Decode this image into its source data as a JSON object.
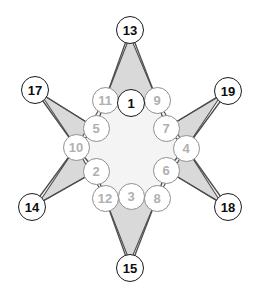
{
  "figure": {
    "type": "graph-diagram",
    "shape": "six-pointed-star",
    "background_color": "#ffffff",
    "star_point_fill": "#d9d9d9",
    "star_core_fill": "#f4f4f4",
    "edge_color": "#4d4d4d"
  },
  "nodes": [
    {
      "id": "13",
      "label": "13",
      "x": 130,
      "y": 30,
      "style": "outer"
    },
    {
      "id": "17",
      "label": "17",
      "x": 35,
      "y": 90,
      "style": "outer"
    },
    {
      "id": "19",
      "label": "19",
      "x": 228,
      "y": 91,
      "style": "outer"
    },
    {
      "id": "14",
      "label": "14",
      "x": 32,
      "y": 207,
      "style": "outer"
    },
    {
      "id": "18",
      "label": "18",
      "x": 228,
      "y": 207,
      "style": "outer"
    },
    {
      "id": "15",
      "label": "15",
      "x": 130,
      "y": 268,
      "style": "outer"
    },
    {
      "id": "1",
      "label": "1",
      "x": 131,
      "y": 103,
      "style": "hub"
    },
    {
      "id": "11",
      "label": "11",
      "x": 105,
      "y": 100,
      "style": "inner"
    },
    {
      "id": "9",
      "label": "9",
      "x": 157,
      "y": 100,
      "style": "inner"
    },
    {
      "id": "5",
      "label": "5",
      "x": 96,
      "y": 128,
      "style": "inner"
    },
    {
      "id": "7",
      "label": "7",
      "x": 166,
      "y": 128,
      "style": "inner"
    },
    {
      "id": "10",
      "label": "10",
      "x": 76,
      "y": 147,
      "style": "inner"
    },
    {
      "id": "4",
      "label": "4",
      "x": 186,
      "y": 148,
      "style": "inner"
    },
    {
      "id": "2",
      "label": "2",
      "x": 96,
      "y": 171,
      "style": "inner"
    },
    {
      "id": "6",
      "label": "6",
      "x": 166,
      "y": 170,
      "style": "inner"
    },
    {
      "id": "12",
      "label": "12",
      "x": 105,
      "y": 198,
      "style": "inner"
    },
    {
      "id": "8",
      "label": "8",
      "x": 157,
      "y": 198,
      "style": "inner"
    },
    {
      "id": "3",
      "label": "3",
      "x": 131,
      "y": 196,
      "style": "inner"
    }
  ],
  "edges": [
    [
      "13",
      "11"
    ],
    [
      "13",
      "9"
    ],
    [
      "17",
      "5"
    ],
    [
      "17",
      "10"
    ],
    [
      "19",
      "7"
    ],
    [
      "19",
      "4"
    ],
    [
      "14",
      "2"
    ],
    [
      "14",
      "10"
    ],
    [
      "18",
      "6"
    ],
    [
      "18",
      "4"
    ],
    [
      "15",
      "12"
    ],
    [
      "15",
      "8"
    ],
    [
      "11",
      "1"
    ],
    [
      "1",
      "9"
    ],
    [
      "11",
      "5"
    ],
    [
      "5",
      "10"
    ],
    [
      "10",
      "2"
    ],
    [
      "2",
      "12"
    ],
    [
      "12",
      "3"
    ],
    [
      "3",
      "8"
    ],
    [
      "8",
      "6"
    ],
    [
      "6",
      "4"
    ],
    [
      "4",
      "7"
    ],
    [
      "7",
      "9"
    ]
  ]
}
